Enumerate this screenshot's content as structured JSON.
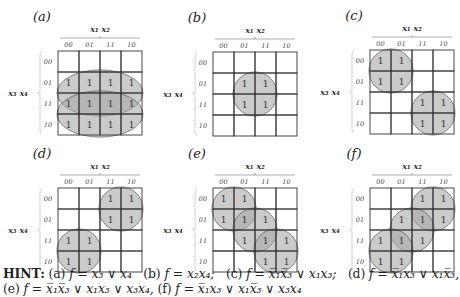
{
  "figure": {
    "col_var_label": "x₁ x₂",
    "row_var_label": "x₃ x₄",
    "col_ticks": [
      "00",
      "01",
      "11",
      "10"
    ],
    "row_ticks": [
      "00",
      "01",
      "11",
      "10"
    ],
    "maps": [
      {
        "id": "a",
        "title": "(a)",
        "origin": [
          58,
          51
        ],
        "ones": [
          [
            1,
            0
          ],
          [
            1,
            1
          ],
          [
            1,
            2
          ],
          [
            1,
            3
          ],
          [
            2,
            0
          ],
          [
            2,
            1
          ],
          [
            2,
            2
          ],
          [
            2,
            3
          ],
          [
            3,
            0
          ],
          [
            3,
            1
          ],
          [
            3,
            2
          ],
          [
            3,
            3
          ]
        ],
        "groups": [
          {
            "shape": "ellipse",
            "cx": 2.0,
            "cy": 2.0,
            "rx": 2.05,
            "ry": 1.1
          },
          {
            "shape": "ellipse",
            "cx": 2.0,
            "cy": 3.0,
            "rx": 2.05,
            "ry": 1.1
          }
        ]
      },
      {
        "id": "b",
        "title": "(b)",
        "origin": [
          213,
          52
        ],
        "ones": [
          [
            1,
            1
          ],
          [
            1,
            2
          ],
          [
            2,
            1
          ],
          [
            2,
            2
          ]
        ],
        "groups": [
          {
            "shape": "circle",
            "cx": 2.0,
            "cy": 2.0,
            "r": 1.05
          }
        ]
      },
      {
        "id": "c",
        "title": "(c)",
        "origin": [
          370,
          50
        ],
        "ones": [
          [
            0,
            0
          ],
          [
            0,
            1
          ],
          [
            1,
            0
          ],
          [
            1,
            1
          ],
          [
            2,
            2
          ],
          [
            2,
            3
          ],
          [
            3,
            2
          ],
          [
            3,
            3
          ]
        ],
        "groups": [
          {
            "shape": "circle",
            "cx": 1.0,
            "cy": 1.0,
            "r": 1.05
          },
          {
            "shape": "circle",
            "cx": 3.0,
            "cy": 3.0,
            "r": 1.05
          }
        ]
      },
      {
        "id": "d",
        "title": "(d)",
        "origin": [
          58,
          188
        ],
        "ones": [
          [
            0,
            2
          ],
          [
            0,
            3
          ],
          [
            1,
            2
          ],
          [
            1,
            3
          ],
          [
            2,
            0
          ],
          [
            2,
            1
          ],
          [
            3,
            0
          ],
          [
            3,
            1
          ]
        ],
        "groups": [
          {
            "shape": "circle",
            "cx": 3.0,
            "cy": 1.0,
            "r": 1.05
          },
          {
            "shape": "circle",
            "cx": 1.0,
            "cy": 3.0,
            "r": 1.05
          }
        ]
      },
      {
        "id": "e",
        "title": "(e)",
        "origin": [
          213,
          188
        ],
        "ones": [
          [
            0,
            0
          ],
          [
            0,
            1
          ],
          [
            1,
            0
          ],
          [
            1,
            1
          ],
          [
            1,
            2
          ],
          [
            2,
            1
          ],
          [
            2,
            2
          ],
          [
            2,
            3
          ],
          [
            3,
            2
          ],
          [
            3,
            3
          ]
        ],
        "groups": [
          {
            "shape": "circle",
            "cx": 1.0,
            "cy": 1.0,
            "r": 1.05
          },
          {
            "shape": "circle",
            "cx": 2.0,
            "cy": 2.0,
            "r": 1.05
          },
          {
            "shape": "circle",
            "cx": 3.0,
            "cy": 3.0,
            "r": 1.05
          }
        ]
      },
      {
        "id": "f",
        "title": "(f)",
        "origin": [
          370,
          188
        ],
        "ones": [
          [
            0,
            2
          ],
          [
            0,
            3
          ],
          [
            1,
            1
          ],
          [
            1,
            2
          ],
          [
            1,
            3
          ],
          [
            2,
            0
          ],
          [
            2,
            1
          ],
          [
            2,
            2
          ],
          [
            3,
            0
          ],
          [
            3,
            1
          ]
        ],
        "groups": [
          {
            "shape": "circle",
            "cx": 3.0,
            "cy": 1.0,
            "r": 1.05
          },
          {
            "shape": "circle",
            "cx": 2.0,
            "cy": 2.0,
            "r": 1.05
          },
          {
            "shape": "circle",
            "cx": 1.0,
            "cy": 3.0,
            "r": 1.05
          }
        ]
      }
    ],
    "cell_size": 21,
    "one_symbol": "1"
  },
  "hint": {
    "label": "HINT:",
    "items": [
      {
        "tag": "(a)",
        "expr": "f = x₃ ∨ x₄"
      },
      {
        "tag": "(b)",
        "expr": "f = x₂x₄;"
      },
      {
        "tag": "(c)",
        "expr": "f = x̅₁x̅₃ ∨ x₁x₃;"
      },
      {
        "tag": "(d)",
        "expr": "f = x̅₁x₃ ∨ x₁x̅₃,"
      },
      {
        "tag": "(e)",
        "expr": "f = x̅₁x̅₃ ∨ x₁x₃ ∨ x₃x₄,"
      },
      {
        "tag": "(f)",
        "expr": "f = x̅₁x₃ ∨ x₁x̅₃ ∨ x₃x₄"
      }
    ]
  }
}
